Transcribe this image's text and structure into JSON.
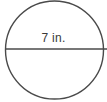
{
  "figure": {
    "name": "circle-with-diameter",
    "shape": "circle",
    "stroke_color": "#4a4a4a",
    "fill_color": "#ffffff",
    "background_color": "#ffffff",
    "text_color": "#3a3a3a",
    "diameter_label": "7 in.",
    "measurement": {
      "value": "7",
      "unit": "in.",
      "quantity": "diameter"
    },
    "geometry": {
      "center_x": "54.5",
      "center_y": "50",
      "radius": "49",
      "diameter_line_y": "49",
      "diameter_line_x1": "5",
      "diameter_line_x2": "107"
    }
  }
}
